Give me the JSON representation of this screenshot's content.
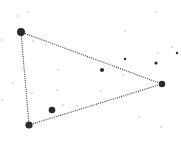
{
  "canvas": {
    "width": 181,
    "height": 145,
    "background": "#ffffff"
  },
  "colors": {
    "edge": "#333333",
    "vertex": "#2b2b2b",
    "faint": "#d6d6d6"
  },
  "triangle": {
    "vertices": [
      {
        "id": "A",
        "x": 21,
        "y": 32,
        "r": 4
      },
      {
        "id": "B",
        "x": 162,
        "y": 84,
        "r": 3.2
      },
      {
        "id": "C",
        "x": 29,
        "y": 125,
        "r": 3.6
      }
    ],
    "edge_style": "dotted"
  },
  "dark_points": [
    {
      "x": 52,
      "y": 110,
      "r": 3.3
    },
    {
      "x": 102,
      "y": 70,
      "r": 2
    },
    {
      "x": 125,
      "y": 59,
      "r": 1.2
    },
    {
      "x": 156,
      "y": 63,
      "r": 1.6
    },
    {
      "x": 177,
      "y": 53,
      "r": 1.2
    }
  ],
  "faint_points": [
    {
      "x": 17,
      "y": 16
    },
    {
      "x": 28,
      "y": 12
    },
    {
      "x": 156,
      "y": 12
    },
    {
      "x": 125,
      "y": 31
    },
    {
      "x": 33,
      "y": 41
    },
    {
      "x": 58,
      "y": 70
    },
    {
      "x": 13,
      "y": 83
    },
    {
      "x": 57,
      "y": 90
    },
    {
      "x": 32,
      "y": 93
    },
    {
      "x": 101,
      "y": 91
    },
    {
      "x": 123,
      "y": 75
    },
    {
      "x": 158,
      "y": 53
    },
    {
      "x": 172,
      "y": 47
    },
    {
      "x": 63,
      "y": 105
    },
    {
      "x": 77,
      "y": 106
    },
    {
      "x": 139,
      "y": 117
    },
    {
      "x": 161,
      "y": 127
    },
    {
      "x": 2,
      "y": 40
    },
    {
      "x": 2,
      "y": 100
    }
  ]
}
